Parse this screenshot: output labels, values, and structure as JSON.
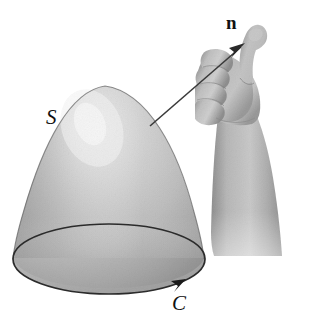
{
  "figure": {
    "background_color": "#ffffff",
    "width": 316,
    "height": 321,
    "labels": {
      "surface": "S",
      "curve": "C",
      "normal": "n"
    },
    "elements": {
      "surface_name": "paraboloid-dome-surface",
      "boundary_name": "oriented-boundary-curve",
      "normal_name": "normal-vector-arrow",
      "hand_name": "right-hand-thumb-up"
    },
    "colors": {
      "ink": "#111111",
      "surface_light": "#ededed",
      "surface_mid": "#b4b4b4",
      "surface_dark": "#8a8a8a",
      "surface_edge": "#4a4a4a",
      "disk_fill": "#b2b2b2",
      "skin_light": "#d6d6d6",
      "skin_mid": "#a9a9a9",
      "skin_dark": "#808080",
      "arrow": "#3a3a3a"
    }
  }
}
